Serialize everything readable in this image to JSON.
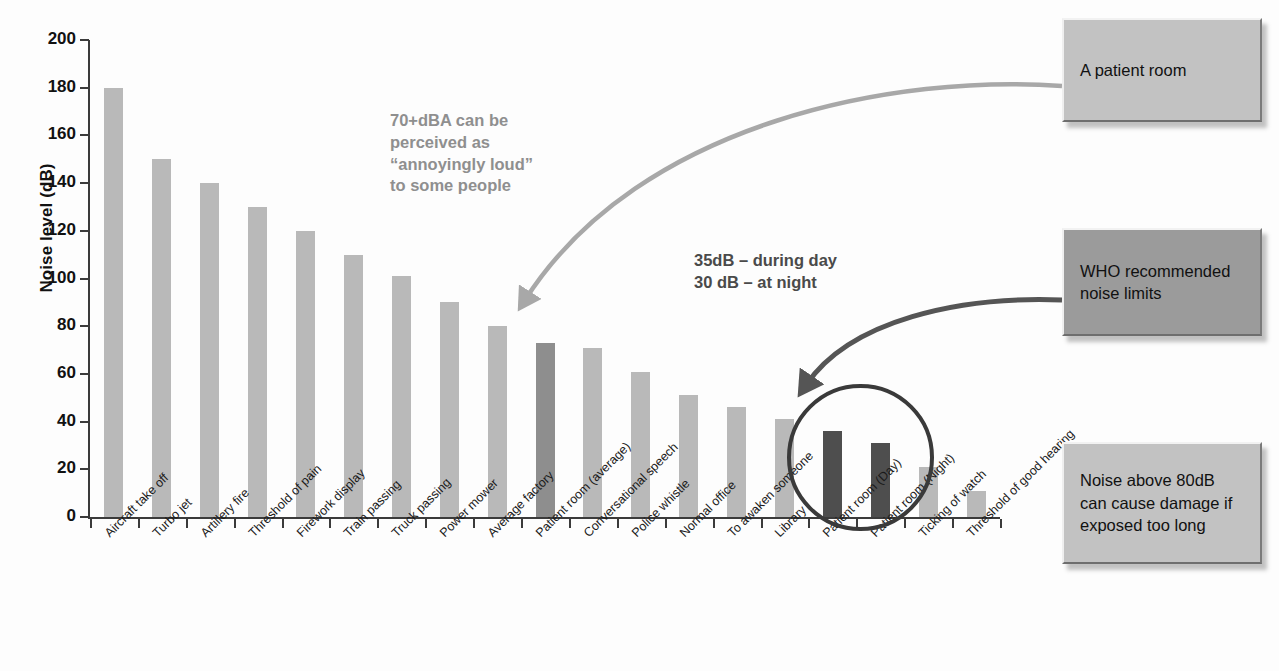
{
  "chart_data": {
    "type": "bar",
    "title": "",
    "xlabel": "",
    "ylabel": "Noise level (dB)",
    "ylim": [
      0,
      200
    ],
    "ytick_step": 20,
    "yticks": [
      "200",
      "180",
      "160",
      "140",
      "120",
      "100",
      "80",
      "60",
      "40",
      "20",
      "0"
    ],
    "grid": false,
    "legend": "none",
    "categories": [
      "Aircraft take off",
      "Turbo jet",
      "Artillery fire",
      "Threshold of pain",
      "Firework display",
      "Train passing",
      "Truck passing",
      "Power mower",
      "Average factory",
      "Patient room (average)",
      "Conversational speech",
      "Police whistle",
      "Normal office",
      "To awaken someone",
      "Library",
      "Patient room (Day)",
      "Patient room (Night)",
      "Ticking of watch",
      "Threshold of good hearing"
    ],
    "values": [
      180,
      150,
      140,
      130,
      120,
      110,
      101,
      90,
      80,
      73,
      71,
      61,
      51,
      46,
      41,
      36,
      31,
      21,
      11
    ],
    "bar_styles": [
      "normal",
      "normal",
      "normal",
      "normal",
      "normal",
      "normal",
      "normal",
      "normal",
      "normal",
      "highlight-mid",
      "normal",
      "normal",
      "normal",
      "normal",
      "normal",
      "highlight-dark",
      "highlight-dark",
      "normal",
      "normal"
    ],
    "colors": {
      "bar_normal": "#b9b9b9",
      "bar_highlight_mid": "#8e8e8e",
      "bar_highlight_dark": "#4e4e4e",
      "axis": "#3b3b3b",
      "arrow_light": "#a8a8a8",
      "arrow_dark": "#555555",
      "circle": "#3a3a3a",
      "callout_light": "#c2c2c2",
      "callout_dark": "#999999",
      "background": "#fdfdfd"
    }
  },
  "annotations": [
    {
      "id": "annoyingly-loud",
      "text": "70+dBA can be\nperceived as\n“annoyingly loud”\nto some people",
      "tone": "light"
    },
    {
      "id": "who-limits-values",
      "text": "35dB – during day\n30 dB – at night",
      "tone": "dark"
    }
  ],
  "callouts": [
    {
      "id": "patient-room",
      "text": "A patient room",
      "tone": "light"
    },
    {
      "id": "who-recommended",
      "text": "WHO recommended\nnoise limits",
      "tone": "dark"
    },
    {
      "id": "noise-above-80db",
      "text": "Noise above 80dB\ncan cause damage if\nexposed too long",
      "tone": "light"
    }
  ]
}
